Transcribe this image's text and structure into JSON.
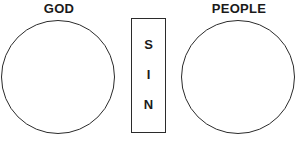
{
  "diagram": {
    "type": "gospel-separation-diagram",
    "left_group": {
      "label": "GOD",
      "shape": "circle"
    },
    "right_group": {
      "label": "PEOPLE",
      "shape": "circle"
    },
    "barrier": {
      "shape": "rectangle",
      "letters": [
        "S",
        "I",
        "N"
      ],
      "word": "SIN"
    },
    "colors": {
      "stroke": "#2b2b2b",
      "text": "#1a1a1a",
      "background": "#ffffff"
    }
  }
}
